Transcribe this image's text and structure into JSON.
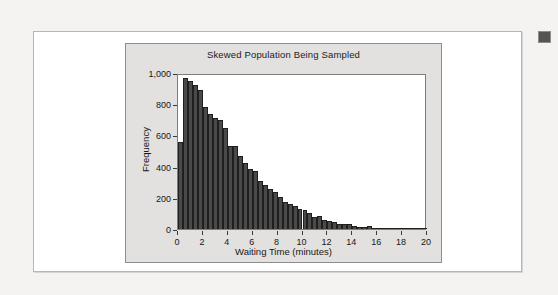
{
  "page": {
    "background_color": "#f4f3f1",
    "card_background": "#ffffff",
    "card_border_color": "#b6b6b6"
  },
  "side_marker": {
    "name": "page-edge-marker",
    "color": "#545454"
  },
  "chart_data": {
    "type": "bar",
    "title": "Skewed Population Being Sampled",
    "xlabel": "Waiting Time (minutes)",
    "ylabel": "Frequency",
    "xlim": [
      0,
      20
    ],
    "ylim": [
      0,
      1000
    ],
    "grid": false,
    "legend": null,
    "bar_color": "#4a4a4a",
    "plot_background": "#ffffff",
    "panel_background": "#e2e1df",
    "bin_width": 0.4,
    "x_ticks": [
      0,
      2,
      4,
      6,
      8,
      10,
      12,
      14,
      16,
      18,
      20
    ],
    "x_tick_labels": [
      "0",
      "2",
      "4",
      "6",
      "8",
      "10",
      "12",
      "14",
      "16",
      "18",
      "20"
    ],
    "y_ticks": [
      0,
      200,
      400,
      600,
      800,
      1000
    ],
    "y_tick_labels": [
      "0",
      "200",
      "400",
      "600",
      "800",
      "1,000"
    ],
    "bin_starts": [
      0.0,
      0.4,
      0.8,
      1.2,
      1.6,
      2.0,
      2.4,
      2.8,
      3.2,
      3.6,
      4.0,
      4.4,
      4.8,
      5.2,
      5.6,
      6.0,
      6.4,
      6.8,
      7.2,
      7.6,
      8.0,
      8.4,
      8.8,
      9.2,
      9.6,
      10.0,
      10.4,
      10.8,
      11.2,
      11.6,
      12.0,
      12.4,
      12.8,
      13.2,
      13.6,
      14.0,
      14.4,
      14.8,
      15.2,
      15.6,
      16.0,
      16.4,
      16.8,
      17.2,
      17.6,
      18.0,
      18.4,
      18.8,
      19.2,
      19.6
    ],
    "values": [
      560,
      970,
      950,
      920,
      890,
      780,
      740,
      710,
      700,
      650,
      535,
      530,
      465,
      420,
      385,
      370,
      310,
      285,
      255,
      235,
      205,
      175,
      160,
      150,
      130,
      125,
      100,
      80,
      85,
      55,
      50,
      45,
      35,
      35,
      30,
      20,
      15,
      12,
      18,
      8,
      6,
      5,
      4,
      4,
      3,
      3,
      2,
      2,
      2,
      2
    ]
  }
}
